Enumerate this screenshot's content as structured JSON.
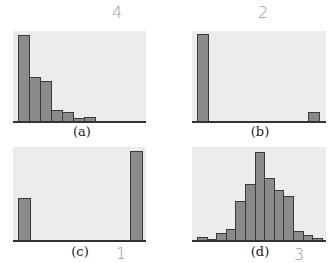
{
  "chart_data": [
    {
      "type": "bar",
      "title": "",
      "panel_label": "(a)",
      "annotation": "4",
      "xlabel": "",
      "ylabel": "",
      "categories": [
        "1",
        "2",
        "3",
        "4",
        "5",
        "6",
        "7",
        "8",
        "9",
        "10",
        "11",
        "12"
      ],
      "values": [
        86,
        44,
        40,
        11,
        9,
        3,
        4,
        0,
        0,
        0,
        0,
        0
      ],
      "grid": false
    },
    {
      "type": "bar",
      "title": "",
      "panel_label": "(b)",
      "annotation": "2",
      "xlabel": "",
      "ylabel": "",
      "categories": [
        "left",
        "right"
      ],
      "values": [
        87,
        9
      ],
      "grid": false
    },
    {
      "type": "bar",
      "title": "",
      "panel_label": "(c)",
      "annotation": "1",
      "xlabel": "",
      "ylabel": "",
      "categories": [
        "left",
        "right"
      ],
      "values": [
        42,
        89
      ],
      "grid": false
    },
    {
      "type": "bar",
      "title": "",
      "panel_label": "(d)",
      "annotation": "3",
      "xlabel": "",
      "ylabel": "",
      "categories": [
        "1",
        "2",
        "3",
        "4",
        "5",
        "6",
        "7",
        "8",
        "9",
        "10",
        "11",
        "12",
        "13"
      ],
      "values": [
        3,
        1,
        7,
        11,
        39,
        56,
        88,
        62,
        50,
        44,
        9,
        5,
        2
      ],
      "grid": false
    }
  ],
  "labels": {
    "a": "(a)",
    "b": "(b)",
    "c": "(c)",
    "d": "(d)"
  },
  "annotations": {
    "a": "4",
    "b": "2",
    "c": "1",
    "d": "3"
  }
}
